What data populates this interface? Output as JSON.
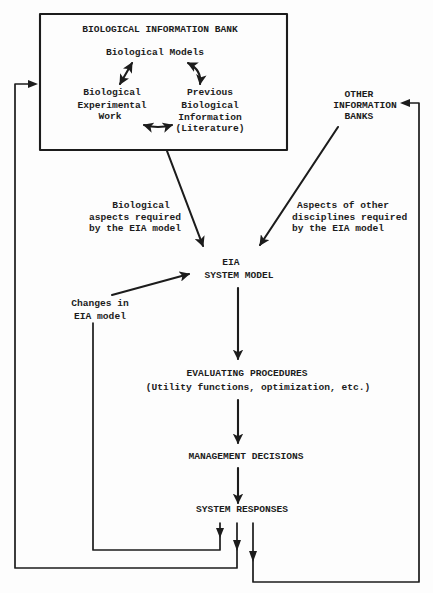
{
  "diagram": {
    "info_bank": {
      "title": "BIOLOGICAL INFORMATION BANK",
      "models": "Biological Models",
      "experimental_work": [
        "Biological",
        "Experimental",
        "Work"
      ],
      "previous_info": [
        "Previous",
        "Biological",
        "Information",
        "(Literature)"
      ]
    },
    "other_banks": [
      "OTHER",
      "INFORMATION",
      "BANKS"
    ],
    "bio_aspects_label": [
      "Biological",
      "aspects required",
      "by the EIA model"
    ],
    "other_aspects_label": [
      "Aspects of other",
      "disciplines required",
      "by the EIA model"
    ],
    "eia_model": [
      "EIA",
      "SYSTEM MODEL"
    ],
    "changes_label": [
      "Changes in",
      "EIA model"
    ],
    "evaluating": {
      "title": "EVALUATING PROCEDURES",
      "subtitle": "(Utility functions, optimization, etc.)"
    },
    "management": "MANAGEMENT DECISIONS",
    "responses": "SYSTEM RESPONSES",
    "edges": [
      {
        "from": "Biological Models",
        "to": "Biological Experimental Work",
        "type": "bidirectional"
      },
      {
        "from": "Biological Models",
        "to": "Previous Biological Information (Literature)",
        "type": "bidirectional"
      },
      {
        "from": "Biological Experimental Work",
        "to": "Previous Biological Information (Literature)",
        "type": "bidirectional"
      },
      {
        "from": "BIOLOGICAL INFORMATION BANK",
        "to": "EIA SYSTEM MODEL",
        "label": "Biological aspects required by the EIA model"
      },
      {
        "from": "OTHER INFORMATION BANKS",
        "to": "EIA SYSTEM MODEL",
        "label": "Aspects of other disciplines required by the EIA model"
      },
      {
        "from": "Changes in EIA model",
        "to": "EIA SYSTEM MODEL"
      },
      {
        "from": "EIA SYSTEM MODEL",
        "to": "EVALUATING PROCEDURES"
      },
      {
        "from": "EVALUATING PROCEDURES",
        "to": "MANAGEMENT DECISIONS"
      },
      {
        "from": "MANAGEMENT DECISIONS",
        "to": "SYSTEM RESPONSES"
      },
      {
        "from": "SYSTEM RESPONSES",
        "to": "Changes in EIA model",
        "type": "feedback"
      },
      {
        "from": "SYSTEM RESPONSES",
        "to": "BIOLOGICAL INFORMATION BANK",
        "type": "feedback"
      },
      {
        "from": "SYSTEM RESPONSES",
        "to": "OTHER INFORMATION BANKS",
        "type": "feedback"
      }
    ]
  },
  "colors": {
    "ink": "#1c1c1c",
    "background": "#fdfdfd"
  }
}
